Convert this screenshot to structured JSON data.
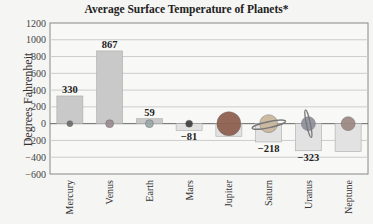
{
  "chart_data": {
    "type": "bar",
    "title": "Average Surface Temperature of Planets*",
    "xlabel": "",
    "ylabel": "Degrees Fahrenheit",
    "categories": [
      "Mercury",
      "Venus",
      "Earth",
      "Mars",
      "Jupiter",
      "Saturn",
      "Uranus",
      "Neptune"
    ],
    "values": [
      330,
      867,
      59,
      -81,
      -150,
      -218,
      -323,
      -330
    ],
    "data_labels": [
      "330",
      "867",
      "59",
      "−81",
      "",
      "−218",
      "−323",
      ""
    ],
    "ylim": [
      -600,
      1200
    ],
    "yticks": [
      1200,
      1000,
      800,
      600,
      400,
      200,
      0,
      -200,
      -400,
      -600
    ],
    "ytick_labels": [
      "1200",
      "1000",
      "800",
      "600",
      "400",
      "200",
      "0",
      "−200",
      "−400",
      "−600"
    ],
    "grid": true,
    "legend": "none",
    "colors": {
      "positive_bar": "#c9c9c9",
      "negative_bar": "#e2e2e2",
      "bar_border": "#aaaaaa",
      "gridline": "#cccccc",
      "zero_line": "#666666"
    }
  }
}
